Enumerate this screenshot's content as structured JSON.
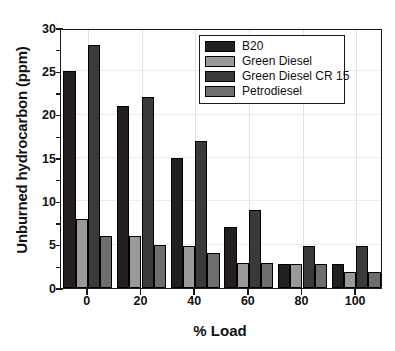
{
  "chart_data": {
    "type": "bar",
    "title": "",
    "xlabel": "% Load",
    "ylabel": "Unburned hydrocarbon (ppm)",
    "categories": [
      "0",
      "20",
      "40",
      "60",
      "80",
      "100"
    ],
    "xlim": [
      -10,
      110
    ],
    "ylim": [
      0,
      30
    ],
    "ytick_labels": [
      "0",
      "5",
      "10",
      "15",
      "20",
      "25",
      "30"
    ],
    "ytick_values": [
      0,
      5,
      10,
      15,
      20,
      25,
      30
    ],
    "yminor_values": [
      2.5,
      7.5,
      12.5,
      17.5,
      22.5,
      27.5
    ],
    "grid": true,
    "legend_position": "top-right",
    "series": [
      {
        "name": "B20",
        "color": "#231f20",
        "values": [
          25,
          21,
          15,
          7,
          2.8,
          2.8
        ]
      },
      {
        "name": "Green Diesel",
        "color": "#9a9a9a",
        "values": [
          8,
          6,
          4.9,
          2.9,
          2.8,
          1.8
        ]
      },
      {
        "name": "Green Diesel CR 15",
        "color": "#3a3a3a",
        "values": [
          28,
          22,
          17,
          9,
          4.9,
          4.9
        ]
      },
      {
        "name": "Petrodiesel",
        "color": "#6e6e6e",
        "values": [
          6,
          5,
          4,
          2.9,
          2.8,
          1.8
        ]
      }
    ]
  },
  "legend": {
    "items": [
      {
        "label": "B20"
      },
      {
        "label": "Green Diesel"
      },
      {
        "label": "Green Diesel CR 15"
      },
      {
        "label": "Petrodiesel"
      }
    ]
  },
  "axes": {
    "y_title": "Unburned hydrocarbon (ppm)",
    "x_title": "% Load"
  }
}
